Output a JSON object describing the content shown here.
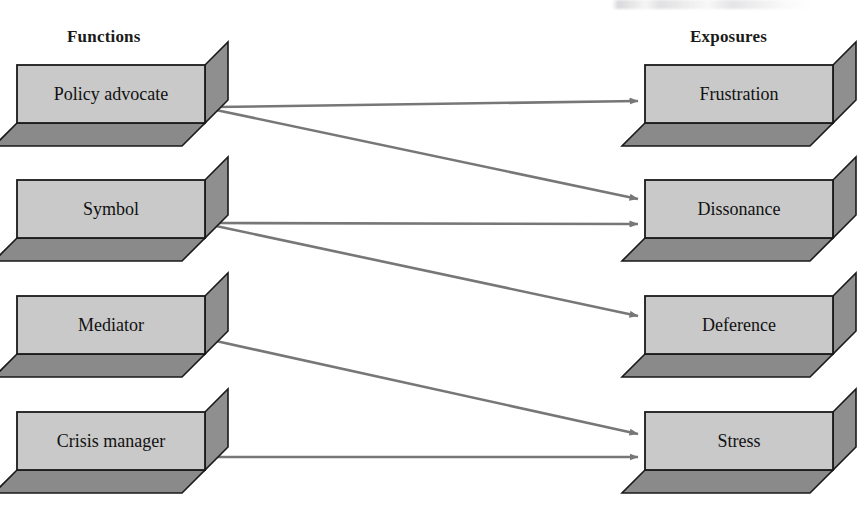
{
  "figure": {
    "title_partial": "",
    "headings": {
      "left": "Functions",
      "right": "Exposures"
    }
  },
  "colors": {
    "box_front": "#c9c9c9",
    "box_side": "#8f8f8f",
    "box_bottom": "#8a8a8a",
    "box_outline": "#1a1a1a",
    "arrow": "#777777",
    "text": "#111111",
    "background": "#ffffff"
  },
  "left_nodes": [
    {
      "id": "policy-advocate",
      "label": "Policy advocate",
      "x": 17,
      "y": 65,
      "w": 188,
      "h": 58
    },
    {
      "id": "symbol",
      "label": "Symbol",
      "x": 17,
      "y": 180,
      "w": 188,
      "h": 58
    },
    {
      "id": "mediator",
      "label": "Mediator",
      "x": 17,
      "y": 296,
      "w": 188,
      "h": 58
    },
    {
      "id": "crisis-manager",
      "label": "Crisis manager",
      "x": 17,
      "y": 412,
      "w": 188,
      "h": 58
    }
  ],
  "right_nodes": [
    {
      "id": "frustration",
      "label": "Frustration",
      "x": 645,
      "y": 65,
      "w": 188,
      "h": 58
    },
    {
      "id": "dissonance",
      "label": "Dissonance",
      "x": 645,
      "y": 180,
      "w": 188,
      "h": 58
    },
    {
      "id": "deference",
      "label": "Deference",
      "x": 645,
      "y": 296,
      "w": 188,
      "h": 58
    },
    {
      "id": "stress",
      "label": "Stress",
      "x": 645,
      "y": 412,
      "w": 188,
      "h": 58
    }
  ],
  "box_depth": {
    "dx": 23,
    "dy": 23
  },
  "edges": [
    {
      "id": "edge-policy-frustration",
      "from": "policy-advocate",
      "to": "frustration",
      "from_label": "Policy advocate",
      "to_label": "Frustration",
      "x1": 216,
      "y1": 107,
      "x2": 638,
      "y2": 101
    },
    {
      "id": "edge-policy-dissonance",
      "from": "policy-advocate",
      "to": "dissonance",
      "from_label": "Policy advocate",
      "to_label": "Dissonance",
      "x1": 216,
      "y1": 110,
      "x2": 638,
      "y2": 199
    },
    {
      "id": "edge-symbol-dissonance",
      "from": "symbol",
      "to": "dissonance",
      "from_label": "Symbol",
      "to_label": "Dissonance",
      "x1": 216,
      "y1": 223,
      "x2": 638,
      "y2": 224
    },
    {
      "id": "edge-symbol-deference",
      "from": "symbol",
      "to": "deference",
      "from_label": "Symbol",
      "to_label": "Deference",
      "x1": 216,
      "y1": 226,
      "x2": 638,
      "y2": 316
    },
    {
      "id": "edge-mediator-stress",
      "from": "mediator",
      "to": "stress",
      "from_label": "Mediator",
      "to_label": "Stress",
      "x1": 216,
      "y1": 341,
      "x2": 638,
      "y2": 434
    },
    {
      "id": "edge-crisis-stress",
      "from": "crisis-manager",
      "to": "stress",
      "from_label": "Crisis manager",
      "to_label": "Stress",
      "x1": 216,
      "y1": 457,
      "x2": 638,
      "y2": 457
    }
  ]
}
